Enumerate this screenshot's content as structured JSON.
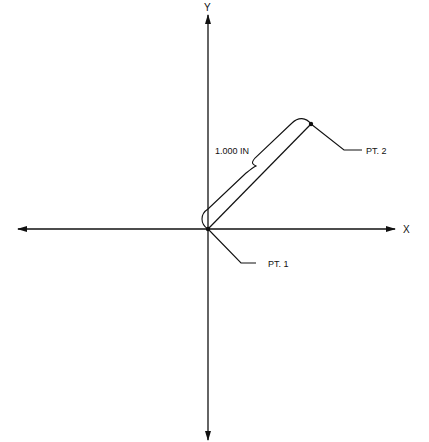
{
  "diagram": {
    "axes": {
      "x_label": "X",
      "y_label": "Y",
      "origin": [
        208,
        229
      ]
    },
    "points": [
      {
        "id": "pt1",
        "label": "PT. 1",
        "position": [
          208,
          229
        ]
      },
      {
        "id": "pt2",
        "label": "PT. 2",
        "position": [
          311,
          124
        ]
      }
    ],
    "dimension": {
      "label": "1.000 IN",
      "from": "PT. 1",
      "to": "PT. 2"
    },
    "colors": {
      "line": "#111111",
      "background": "#ffffff"
    }
  }
}
